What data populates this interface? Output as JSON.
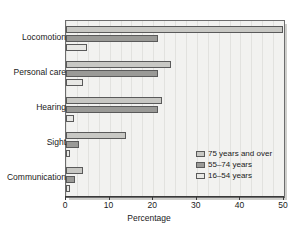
{
  "chart_data": {
    "type": "bar",
    "orientation": "horizontal",
    "title": "",
    "xlabel": "Percentage",
    "ylabel": "",
    "xlim": [
      0,
      50
    ],
    "xticks": [
      0,
      10,
      20,
      30,
      40,
      50
    ],
    "xtick_labels": [
      "0",
      "10",
      "20",
      "30",
      "40",
      "50"
    ],
    "grid": true,
    "legend_position": "inside-lower-right",
    "categories": [
      "Locomotion",
      "Personal care",
      "Hearing",
      "Sight",
      "Communication"
    ],
    "series": [
      {
        "name": "75 years and over",
        "color": "#c8c8c4",
        "values": [
          49.8,
          24.0,
          22.0,
          13.8,
          4.0
        ]
      },
      {
        "name": "55–74 years",
        "color": "#9a9a97",
        "values": [
          21.0,
          21.0,
          21.0,
          3.0,
          2.0
        ]
      },
      {
        "name": "16–54 years",
        "color": "#e8e8e5",
        "values": [
          4.8,
          3.8,
          1.8,
          1.0,
          1.0
        ]
      }
    ]
  },
  "legend": {
    "items": [
      {
        "label": "75 years and over"
      },
      {
        "label": "55–74 years"
      },
      {
        "label": "16–54 years"
      }
    ]
  }
}
